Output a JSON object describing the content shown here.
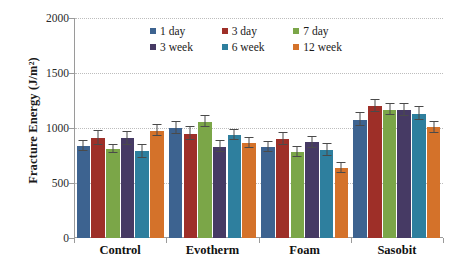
{
  "chart_data": {
    "type": "bar",
    "title": "",
    "xlabel": "",
    "ylabel": "Fracture Energy (J/m²)",
    "ylim": [
      0,
      2000
    ],
    "yticks": [
      0,
      500,
      1000,
      1500,
      2000
    ],
    "ytick_labels": [
      "0",
      "500",
      "1000",
      "1500",
      "2000"
    ],
    "grid": "horizontal-dotted",
    "legend_position": "top-center-inside",
    "categories": [
      "Control",
      "Evotherm",
      "Foam",
      "Sasobit"
    ],
    "series": [
      {
        "name": "1 day",
        "color": "#3d6390",
        "values": [
          835,
          1000,
          830,
          1075
        ],
        "errors": [
          45,
          55,
          45,
          60
        ]
      },
      {
        "name": "3 day",
        "color": "#9e2f28",
        "values": [
          910,
          950,
          900,
          1200
        ],
        "errors": [
          65,
          55,
          55,
          55
        ]
      },
      {
        "name": "7 day",
        "color": "#7ba648",
        "values": [
          810,
          1055,
          780,
          1165
        ],
        "errors": [
          35,
          50,
          45,
          50
        ]
      },
      {
        "name": "3 week",
        "color": "#463a64",
        "values": [
          905,
          830,
          870,
          1165
        ],
        "errors": [
          55,
          50,
          50,
          55
        ]
      },
      {
        "name": "6 week",
        "color": "#2e7f9e",
        "values": [
          790,
          940,
          800,
          1130
        ],
        "errors": [
          60,
          45,
          55,
          60
        ]
      },
      {
        "name": "12 week",
        "color": "#d4722a",
        "values": [
          975,
          860,
          640,
          1005
        ],
        "errors": [
          50,
          45,
          45,
          50
        ]
      }
    ]
  },
  "axis": {
    "y_title": "Fracture Energy (J/m²)"
  }
}
